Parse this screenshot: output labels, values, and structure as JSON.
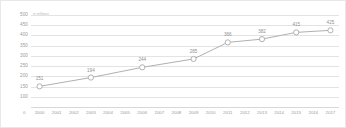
{
  "chart_data": {
    "type": "line",
    "title": "",
    "subtitle": "",
    "xlabel": "",
    "ylabel": "",
    "y_unit_label": "in millions",
    "categories": [
      "2000",
      "2001",
      "2002",
      "2003",
      "2004",
      "2005",
      "2006",
      "2007",
      "2008",
      "2009",
      "2010",
      "2011",
      "2012",
      "2013",
      "2014",
      "2015",
      "2016",
      "2017"
    ],
    "series": [
      {
        "name": "Value",
        "points": [
          {
            "x": "2000",
            "y": 151,
            "label": "151",
            "marker": true
          },
          {
            "x": "2003",
            "y": 194,
            "label": "194",
            "marker": true
          },
          {
            "x": "2006",
            "y": 244,
            "label": "244",
            "marker": true
          },
          {
            "x": "2009",
            "y": 285,
            "label": "285",
            "marker": true
          },
          {
            "x": "2011",
            "y": 366,
            "label": "366",
            "marker": true
          },
          {
            "x": "2013",
            "y": 382,
            "label": "382",
            "marker": true
          },
          {
            "x": "2015",
            "y": 415,
            "label": "415",
            "marker": true
          },
          {
            "x": "2017",
            "y": 425,
            "label": "425",
            "marker": true
          }
        ]
      }
    ],
    "y_ticks": [
      0,
      100,
      150,
      200,
      250,
      300,
      350,
      400,
      450,
      500
    ],
    "y_tick_labels": [
      "0",
      "100",
      "150",
      "200",
      "250",
      "300",
      "350",
      "400",
      "450",
      "500"
    ],
    "ylim": [
      0,
      500
    ],
    "grid": true,
    "legend": false,
    "colors": {
      "line": "#b0b0b0",
      "marker_fill": "#ffffff",
      "marker_stroke": "#a8a8a8",
      "gridline": "#e3e3e3",
      "tick_text": "#9a9a9a",
      "data_label": "#8f8f8f",
      "background": "#ffffff",
      "border": "#e8e8e8"
    }
  }
}
